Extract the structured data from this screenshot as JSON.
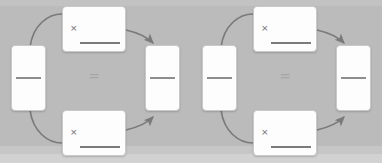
{
  "canvas": {
    "width": 382,
    "height": 163,
    "background_color": "#bcbcbc",
    "footer_band_color": "#d2d2d2"
  },
  "colors": {
    "card_fill": "#fdfdfd",
    "card_border": "#c9c9c9",
    "fraction_bar": "#8e8e8e",
    "fraction_bar_dark": "#7b7b7b",
    "arrow": "#7a7a7a",
    "times_glyph": "#6e6e6e",
    "equals_glyph": "#a6a6a6"
  },
  "diagram": {
    "operator_symbol": "=",
    "multiply_symbol": "×",
    "panels": [
      {
        "id": "panel-left",
        "cards": {
          "operand": {
            "icon": "fraction-bar-icon",
            "bar_position": "center"
          },
          "multiplier_top": {
            "symbol": "×",
            "icon": "fraction-bar-icon",
            "bar_position": "bottom"
          },
          "multiplier_bottom": {
            "symbol": "×",
            "icon": "fraction-bar-icon",
            "bar_position": "bottom"
          },
          "result": {
            "icon": "fraction-bar-icon",
            "bar_position": "center"
          }
        },
        "arrows": [
          {
            "id": "arrow-top",
            "from": "operand",
            "to": "result",
            "path": "upper-arc",
            "direction": "clockwise"
          },
          {
            "id": "arrow-bottom",
            "from": "operand",
            "to": "result",
            "path": "lower-arc",
            "direction": "counter-clockwise"
          }
        ],
        "equals": "="
      },
      {
        "id": "panel-right",
        "cards": {
          "operand": {
            "icon": "fraction-bar-icon",
            "bar_position": "center"
          },
          "multiplier_top": {
            "symbol": "×",
            "icon": "fraction-bar-icon",
            "bar_position": "bottom"
          },
          "multiplier_bottom": {
            "symbol": "×",
            "icon": "fraction-bar-icon",
            "bar_position": "bottom"
          },
          "result": {
            "icon": "fraction-bar-icon",
            "bar_position": "center"
          }
        },
        "arrows": [
          {
            "id": "arrow-top",
            "from": "operand",
            "to": "result",
            "path": "upper-arc",
            "direction": "clockwise"
          },
          {
            "id": "arrow-bottom",
            "from": "operand",
            "to": "result",
            "path": "lower-arc",
            "direction": "counter-clockwise"
          }
        ],
        "equals": "="
      }
    ]
  }
}
